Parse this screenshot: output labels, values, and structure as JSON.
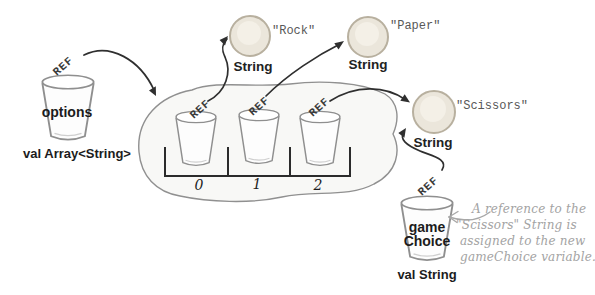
{
  "colors": {
    "ball_fill": "#ebe6db",
    "ball_highlight": "#f4f0e7",
    "ball_stroke": "#b8b09f",
    "sketch_stroke": "#8f8f8f",
    "bracket_stroke": "#2b2b2b",
    "arrow": "#2f2f2f",
    "annotation_gray": "#a3a3a3",
    "blob_fill": "#f8f8f6"
  },
  "options_var": {
    "ref": "REF",
    "name": "options",
    "type": "val Array<String>"
  },
  "array_box": {
    "cells": [
      {
        "index": "0",
        "ref": "REF"
      },
      {
        "index": "1",
        "ref": "REF"
      },
      {
        "index": "2",
        "ref": "REF"
      }
    ]
  },
  "strings": [
    {
      "value": "\"Rock\"",
      "type": "String"
    },
    {
      "value": "\"Paper\"",
      "type": "String"
    },
    {
      "value": "\"Scissors\"",
      "type": "String"
    }
  ],
  "game_choice_var": {
    "ref": "REF",
    "name_line1": "game",
    "name_line2": "Choice",
    "type": "val String"
  },
  "annotation": {
    "lines": [
      "A reference to the",
      "\"Scissors\" String is",
      "assigned to the new",
      "gameChoice variable."
    ]
  }
}
